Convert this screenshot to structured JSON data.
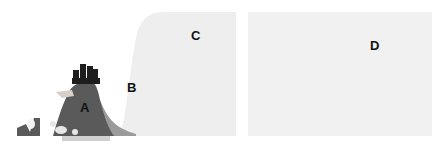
{
  "diagram": {
    "regions": [
      {
        "id": "A",
        "label": "A",
        "description": "dark mound with tower-like figures on top"
      },
      {
        "id": "B",
        "label": "B",
        "description": "mid-gray slope at base of mound"
      },
      {
        "id": "C",
        "label": "C",
        "description": "large light-gray curved panel"
      },
      {
        "id": "D",
        "label": "D",
        "description": "light-gray rectangular panel"
      }
    ]
  },
  "colors": {
    "background": "#ffffff",
    "region_a": "#5a5a5a",
    "region_b": "#9a9a9a",
    "region_c": "#eeeeee",
    "region_d": "#f1f1f1",
    "label": "#111111"
  }
}
